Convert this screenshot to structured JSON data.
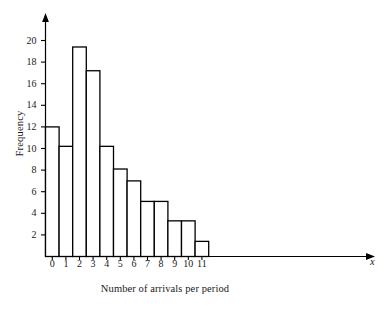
{
  "chart_data": {
    "type": "bar",
    "title": "",
    "subtitle": "",
    "xlabel": "Number of arrivals per period",
    "ylabel": "Frequency",
    "x_axis_variable": "x",
    "categories": [
      "0",
      "1",
      "2",
      "3",
      "4",
      "5",
      "6",
      "7",
      "8",
      "9",
      "10",
      "11"
    ],
    "values": [
      12,
      10.2,
      19.4,
      17.2,
      10.2,
      8.1,
      7,
      5.1,
      5.1,
      3.3,
      3.3,
      1.4
    ],
    "series": [
      {
        "name": "Frequency",
        "values": [
          12,
          10.2,
          19.4,
          17.2,
          10.2,
          8.1,
          7,
          5.1,
          5.1,
          3.3,
          3.3,
          1.4
        ]
      }
    ],
    "ylim": [
      0,
      23
    ],
    "xlim": [
      0,
      12
    ],
    "ytick_labels": [
      "2",
      "4",
      "6",
      "8",
      "10",
      "12",
      "14",
      "16",
      "18",
      "20"
    ],
    "ytick_values": [
      2,
      4,
      6,
      8,
      10,
      12,
      14,
      16,
      18,
      20
    ],
    "xtick_labels": [
      "0",
      "1",
      "2",
      "3",
      "4",
      "5",
      "6",
      "7",
      "8",
      "9",
      "10",
      "11"
    ],
    "grid": false,
    "legend": false,
    "legend_position": "none",
    "bar_fill_color": "#ffffff",
    "bar_edge_color": "#000000",
    "axis_color": "#000000",
    "background_color": "#ffffff",
    "annotations": []
  }
}
